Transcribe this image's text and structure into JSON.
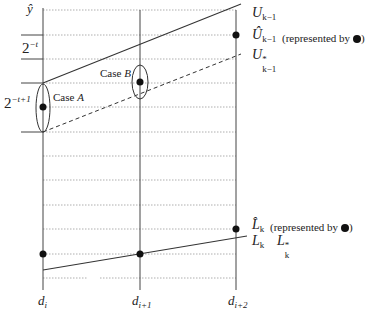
{
  "diagram": {
    "axis_label": "ŷ",
    "columns": [
      {
        "label": "d",
        "sub": "i"
      },
      {
        "label": "d",
        "sub": "i+1"
      },
      {
        "label": "d",
        "sub": "i+2"
      }
    ],
    "left_labels": {
      "step_label": {
        "base": "2",
        "exp": "−t"
      },
      "step_label_2": {
        "base": "2",
        "exp": "−t+1"
      }
    },
    "cases": {
      "case_a": {
        "prefix": "Case ",
        "letter": "A"
      },
      "case_b": {
        "prefix": "Case ",
        "letter": "B"
      }
    },
    "right_labels": {
      "u_k1": {
        "base": "U",
        "sub": "k−1"
      },
      "u_hat_k1": {
        "base": "Û",
        "sub": "k−1",
        "note": "(represented by"
      },
      "u_star_k1": {
        "base": "U",
        "sup": "*",
        "sub": "k−1"
      },
      "l_hat_k": {
        "base": "L̂",
        "sub": "k",
        "note": "(represented by"
      },
      "l_k": {
        "base": "L",
        "sub": "k"
      },
      "l_star_k": {
        "base": "L",
        "sup": "*",
        "sub": "k"
      }
    },
    "closing_paren": ")",
    "colors": {
      "line": "#333333",
      "grid": "#999999",
      "dot": "#111111"
    }
  }
}
